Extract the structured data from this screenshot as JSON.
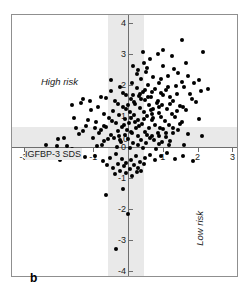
{
  "figure": {
    "panel_label": "b",
    "background_color": "#ffffff",
    "frame_color": "#8f8f8f",
    "band_color": "#e9e9e9",
    "point_color": "#000000"
  },
  "annotations": [
    {
      "text": "High risk",
      "position": "upper-left",
      "orientation": "horizontal"
    },
    {
      "text": "Low risk",
      "position": "lower-right",
      "orientation": "vertical"
    }
  ],
  "labels": {
    "high_risk": "High risk",
    "low_risk": "Low risk",
    "y_axis_title": "IGFBP-3 SDS",
    "x_axis_title": "IGF-1 SDS"
  },
  "chart_data": {
    "type": "scatter",
    "title": "",
    "xlabel": "IGF-1 SDS",
    "ylabel": "IGFBP-3 SDS",
    "xlim": [
      -3,
      3
    ],
    "ylim": [
      -4,
      4
    ],
    "xticks": [
      -3,
      -2,
      -1,
      0,
      1,
      2,
      3
    ],
    "yticks": [
      -4,
      -3,
      -2,
      -1,
      0,
      1,
      2,
      3,
      4
    ],
    "xtick_labels": [
      "-3",
      "-2",
      "-1",
      "0",
      "1",
      "2",
      "3"
    ],
    "ytick_labels": [
      "-4",
      "-3",
      "-2",
      "-1",
      "0",
      "1",
      "2",
      "3",
      "4"
    ],
    "grid": false,
    "legend": false,
    "reference_bands": [
      {
        "axis": "x",
        "from": -0.6,
        "to": 0.45,
        "color": "#e9e9e9"
      },
      {
        "axis": "y",
        "from": 0.0,
        "to": 0.68,
        "color": "#e9e9e9"
      }
    ],
    "reference_lines": [
      {
        "axis": "x",
        "value": 0
      },
      {
        "axis": "y",
        "value": 0
      }
    ],
    "series": [
      {
        "name": "patients",
        "marker": "circle",
        "color": "#000000",
        "points": [
          [
            1.55,
            3.45
          ],
          [
            2.15,
            3.05
          ],
          [
            0.85,
            3.0
          ],
          [
            1.25,
            2.95
          ],
          [
            0.63,
            2.85
          ],
          [
            0.45,
            2.72
          ],
          [
            1.02,
            2.62
          ],
          [
            0.3,
            2.5
          ],
          [
            0.52,
            2.42
          ],
          [
            1.72,
            2.3
          ],
          [
            1.15,
            2.28
          ],
          [
            0.72,
            2.25
          ],
          [
            0.36,
            2.2
          ],
          [
            2.05,
            2.15
          ],
          [
            1.55,
            2.1
          ],
          [
            0.9,
            2.08
          ],
          [
            0.12,
            2.05
          ],
          [
            0.58,
            2.0
          ],
          [
            1.38,
            1.98
          ],
          [
            1.62,
            1.95
          ],
          [
            -0.22,
            1.92
          ],
          [
            0.26,
            1.9
          ],
          [
            0.78,
            1.88
          ],
          [
            1.08,
            1.85
          ],
          [
            2.1,
            1.82
          ],
          [
            -0.48,
            1.8
          ],
          [
            0.42,
            1.78
          ],
          [
            0.95,
            1.75
          ],
          [
            1.42,
            1.72
          ],
          [
            1.78,
            1.7
          ],
          [
            -0.05,
            1.68
          ],
          [
            0.33,
            1.65
          ],
          [
            0.66,
            1.62
          ],
          [
            1.2,
            1.6
          ],
          [
            -0.62,
            1.58
          ],
          [
            0.08,
            1.55
          ],
          [
            0.5,
            1.52
          ],
          [
            0.85,
            1.5
          ],
          [
            1.3,
            1.48
          ],
          [
            1.95,
            1.45
          ],
          [
            -1.35,
            1.42
          ],
          [
            -0.3,
            1.4
          ],
          [
            0.2,
            1.38
          ],
          [
            0.6,
            1.36
          ],
          [
            0.98,
            1.34
          ],
          [
            1.5,
            1.32
          ],
          [
            -0.85,
            1.3
          ],
          [
            -0.15,
            1.28
          ],
          [
            0.35,
            1.26
          ],
          [
            0.72,
            1.24
          ],
          [
            1.12,
            1.22
          ],
          [
            1.68,
            1.2
          ],
          [
            -1.05,
            1.18
          ],
          [
            -0.42,
            1.16
          ],
          [
            0.05,
            1.14
          ],
          [
            0.45,
            1.12
          ],
          [
            0.88,
            1.1
          ],
          [
            1.25,
            1.08
          ],
          [
            -0.7,
            1.06
          ],
          [
            -0.25,
            1.04
          ],
          [
            0.18,
            1.02
          ],
          [
            0.55,
            1.0
          ],
          [
            0.95,
            0.98
          ],
          [
            1.35,
            0.96
          ],
          [
            -1.55,
            0.94
          ],
          [
            -0.55,
            0.92
          ],
          [
            -0.1,
            0.9
          ],
          [
            0.28,
            0.88
          ],
          [
            0.68,
            0.86
          ],
          [
            1.05,
            0.84
          ],
          [
            1.55,
            0.82
          ],
          [
            -0.92,
            0.8
          ],
          [
            -0.35,
            0.78
          ],
          [
            0.02,
            0.76
          ],
          [
            0.4,
            0.74
          ],
          [
            0.78,
            0.72
          ],
          [
            1.18,
            0.7
          ],
          [
            -1.2,
            0.68
          ],
          [
            -0.62,
            0.66
          ],
          [
            -0.18,
            0.64
          ],
          [
            0.22,
            0.62
          ],
          [
            0.6,
            0.6
          ],
          [
            1.0,
            0.58
          ],
          [
            1.45,
            0.56
          ],
          [
            -0.78,
            0.54
          ],
          [
            -0.28,
            0.52
          ],
          [
            0.1,
            0.5
          ],
          [
            0.48,
            0.48
          ],
          [
            0.85,
            0.46
          ],
          [
            1.3,
            0.44
          ],
          [
            -1.42,
            0.42
          ],
          [
            -0.5,
            0.4
          ],
          [
            -0.08,
            0.38
          ],
          [
            0.3,
            0.36
          ],
          [
            0.7,
            0.34
          ],
          [
            1.1,
            0.32
          ],
          [
            -1.0,
            0.3
          ],
          [
            -0.4,
            0.28
          ],
          [
            0.0,
            0.26
          ],
          [
            0.38,
            0.24
          ],
          [
            0.75,
            0.22
          ],
          [
            1.2,
            0.2
          ],
          [
            -0.68,
            0.18
          ],
          [
            -0.2,
            0.16
          ],
          [
            0.15,
            0.14
          ],
          [
            0.52,
            0.12
          ],
          [
            0.9,
            0.1
          ],
          [
            1.6,
            0.08
          ],
          [
            -2.35,
            0.06
          ],
          [
            -1.75,
            0.04
          ],
          [
            -0.88,
            0.02
          ],
          [
            -0.32,
            0.0
          ],
          [
            0.05,
            -0.02
          ],
          [
            0.42,
            -0.04
          ],
          [
            0.8,
            -0.06
          ],
          [
            -1.3,
            1.55
          ],
          [
            -1.1,
            1.48
          ],
          [
            -0.95,
            0.6
          ],
          [
            -0.75,
            0.05
          ],
          [
            -1.5,
            0.62
          ],
          [
            0.25,
            2.35
          ],
          [
            0.55,
            2.55
          ],
          [
            0.18,
            1.45
          ],
          [
            0.82,
            1.42
          ],
          [
            1.22,
            1.38
          ],
          [
            -0.12,
            0.72
          ],
          [
            0.32,
            0.68
          ],
          [
            0.65,
            1.18
          ],
          [
            1.02,
            1.68
          ],
          [
            1.4,
            1.15
          ],
          [
            0.08,
            0.95
          ],
          [
            0.45,
            0.9
          ],
          [
            -0.05,
            1.22
          ],
          [
            0.62,
            0.28
          ],
          [
            0.92,
            0.62
          ],
          [
            -0.25,
            0.35
          ],
          [
            0.12,
            0.45
          ],
          [
            0.35,
            1.72
          ],
          [
            0.72,
            0.95
          ],
          [
            1.08,
            0.45
          ],
          [
            -0.45,
            0.85
          ],
          [
            -0.02,
            0.55
          ],
          [
            0.28,
            0.05
          ],
          [
            0.58,
            1.62
          ],
          [
            0.88,
            1.28
          ],
          [
            -0.58,
            0.25
          ],
          [
            -0.15,
            1.75
          ],
          [
            0.2,
            0.8
          ],
          [
            0.5,
            1.85
          ],
          [
            0.98,
            0.15
          ],
          [
            -0.82,
            0.45
          ],
          [
            -0.38,
            1.48
          ],
          [
            0.0,
            1.35
          ],
          [
            0.38,
            1.55
          ],
          [
            0.68,
            1.78
          ],
          [
            -1.15,
            0.88
          ],
          [
            -0.68,
            0.68
          ],
          [
            -0.22,
            0.22
          ],
          [
            0.15,
            1.68
          ],
          [
            0.55,
            0.38
          ],
          [
            1.15,
            1.95
          ],
          [
            1.48,
            0.75
          ],
          [
            1.85,
            1.55
          ],
          [
            2.05,
            0.9
          ],
          [
            2.3,
            1.88
          ],
          [
            1.32,
            2.52
          ],
          [
            1.68,
            2.72
          ],
          [
            1.28,
            0.62
          ],
          [
            1.72,
            0.42
          ],
          [
            2.12,
            0.35
          ],
          [
            0.95,
            2.18
          ],
          [
            1.45,
            2.38
          ],
          [
            1.9,
            2.05
          ],
          [
            1.58,
            1.28
          ],
          [
            1.18,
            0.05
          ],
          [
            -1.85,
            0.3
          ],
          [
            -2.05,
            0.02
          ],
          [
            -1.62,
            -0.08
          ],
          [
            -2.2,
            -0.25
          ],
          [
            -1.95,
            -0.42
          ],
          [
            -1.45,
            -0.18
          ],
          [
            -1.25,
            -0.32
          ],
          [
            -0.95,
            -0.28
          ],
          [
            -0.72,
            -0.45
          ],
          [
            -0.52,
            -0.35
          ],
          [
            -0.35,
            -0.22
          ],
          [
            -0.18,
            -0.38
          ],
          [
            -0.05,
            -0.52
          ],
          [
            0.08,
            -0.42
          ],
          [
            0.22,
            -0.3
          ],
          [
            0.35,
            -0.48
          ],
          [
            0.48,
            -0.35
          ],
          [
            0.62,
            -0.25
          ],
          [
            0.78,
            -0.42
          ],
          [
            0.95,
            -0.3
          ],
          [
            1.12,
            -0.2
          ],
          [
            1.35,
            -0.38
          ],
          [
            1.58,
            -0.28
          ],
          [
            1.88,
            -0.45
          ],
          [
            -2.5,
            -0.35
          ],
          [
            -0.12,
            -0.62
          ],
          [
            0.05,
            -0.72
          ],
          [
            -0.28,
            -0.55
          ],
          [
            0.18,
            -0.58
          ],
          [
            -0.42,
            -0.68
          ],
          [
            0.3,
            -0.68
          ],
          [
            -0.6,
            -0.58
          ],
          [
            0.45,
            -0.55
          ],
          [
            -0.05,
            -0.85
          ],
          [
            0.12,
            -0.92
          ],
          [
            -0.22,
            -0.78
          ],
          [
            0.25,
            -0.82
          ],
          [
            -0.38,
            -0.88
          ],
          [
            0.38,
            -0.78
          ],
          [
            -0.15,
            -1.35
          ],
          [
            0.0,
            -2.15
          ],
          [
            -0.62,
            -1.55
          ],
          [
            -0.35,
            -3.3
          ],
          [
            -0.48,
            2.15
          ],
          [
            -0.78,
            1.62
          ],
          [
            -1.62,
            1.35
          ],
          [
            -1.28,
            0.52
          ],
          [
            -2.0,
            0.25
          ],
          [
            0.15,
            2.62
          ],
          [
            0.42,
            3.08
          ],
          [
            1.02,
            3.12
          ],
          [
            0.68,
            1.05
          ],
          [
            0.88,
            0.35
          ]
        ]
      }
    ]
  }
}
